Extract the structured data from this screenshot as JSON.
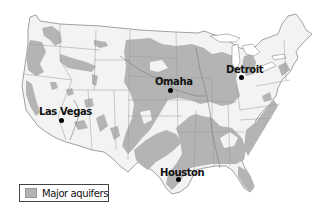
{
  "map": {
    "title": "Major aquifers of the contiguous United States",
    "colors": {
      "land": "#f3f3f3",
      "aquifer": "#b4b4b4",
      "border": "#8a8a8a",
      "water": "#ffffff"
    },
    "cities": [
      {
        "name": "Omaha",
        "label": "Omaha"
      },
      {
        "name": "Detroit",
        "label": "Detroit"
      },
      {
        "name": "Las Vegas",
        "label": "Las Vegas"
      },
      {
        "name": "Houston",
        "label": "Houston"
      }
    ],
    "legend": {
      "items": [
        {
          "label": "Major aquifers",
          "color": "#b4b4b4"
        }
      ]
    }
  }
}
